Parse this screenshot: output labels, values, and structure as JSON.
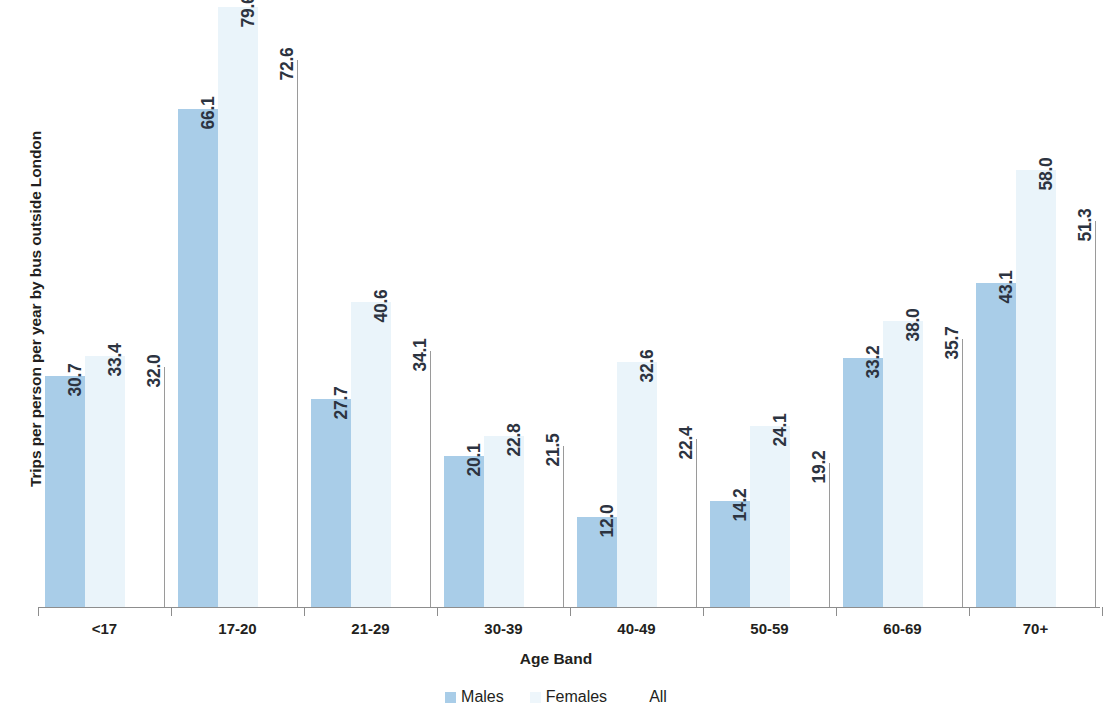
{
  "chart_data": {
    "type": "bar",
    "title": "",
    "xlabel": "Age Band",
    "ylabel": "Trips per person per year by bus outside London",
    "ylim": [
      0,
      80
    ],
    "grid": false,
    "legend_position": "bottom",
    "categories": [
      "<17",
      "17-20",
      "21-29",
      "30-39",
      "40-49",
      "50-59",
      "60-69",
      "70+"
    ],
    "series": [
      {
        "name": "Males",
        "color": "#a9cde8",
        "values": [
          30.7,
          66.1,
          27.7,
          20.1,
          12.0,
          14.2,
          33.2,
          43.1
        ],
        "labels": [
          "30.7",
          "66.1",
          "27.7",
          "20.1",
          "12.0",
          "14.2",
          "33.2",
          "43.1"
        ]
      },
      {
        "name": "Females",
        "color": "#eaf4fa",
        "values": [
          33.4,
          79.6,
          40.6,
          22.8,
          32.6,
          24.1,
          38.0,
          58.0
        ],
        "labels": [
          "33.4",
          "79.6",
          "40.6",
          "22.8",
          "32.6",
          "24.1",
          "38.0",
          "58.0"
        ]
      },
      {
        "name": "All",
        "color": "#ffffff",
        "values": [
          32.0,
          72.6,
          34.1,
          21.5,
          22.4,
          19.2,
          35.7,
          51.3
        ],
        "labels": [
          "32.0",
          "72.6",
          "34.1",
          "21.5",
          "22.4",
          "19.2",
          "35.7",
          "51.3"
        ]
      }
    ]
  },
  "axes": {
    "y_title": "Trips per person per year by bus outside London",
    "x_title": "Age Band"
  },
  "legend": {
    "items": [
      {
        "label": "Males",
        "color": "#a9cde8"
      },
      {
        "label": "Females",
        "color": "#eef6fb"
      },
      {
        "label": "All",
        "color": "#ffffff"
      }
    ]
  }
}
